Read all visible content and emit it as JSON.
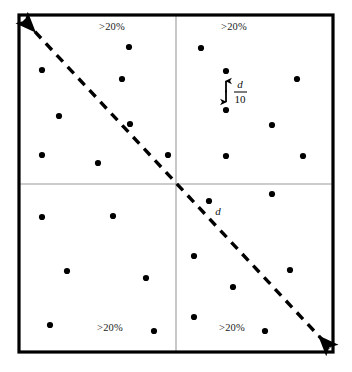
{
  "figure": {
    "name": "quadrant-point-distribution-diagram",
    "canvas": {
      "width": 352,
      "height": 372
    },
    "colors": {
      "background": "#ffffff",
      "border": "#000000",
      "gridline": "#9a9a9a",
      "point": "#000000",
      "diagonal": "#000000",
      "text": "#111111"
    },
    "frame": {
      "left": 19,
      "top": 15,
      "right": 333,
      "bottom": 352,
      "stroke_width": 3.2
    },
    "gridlines": {
      "vertical_x": 176,
      "horizontal_y": 184,
      "stroke_width": 1.1
    },
    "quadrants": [
      {
        "name": "top-left",
        "label": ">20%",
        "label_x": 112,
        "label_y": 28
      },
      {
        "name": "top-right",
        "label": ">20%",
        "label_x": 234,
        "label_y": 28
      },
      {
        "name": "bottom-left",
        "label": ">20%",
        "label_x": 110,
        "label_y": 329
      },
      {
        "name": "bottom-right",
        "label": ">20%",
        "label_x": 232,
        "label_y": 329
      }
    ],
    "diagonal": {
      "name": "double-headed-dashed-diagonal",
      "from_x": 24,
      "from_y": 20,
      "to_x": 330,
      "to_y": 348,
      "stroke_width": 3.4,
      "dash": "9 7",
      "arrowheads": "both"
    },
    "points": [
      {
        "x": 129,
        "y": 47
      },
      {
        "x": 42,
        "y": 70
      },
      {
        "x": 122,
        "y": 79
      },
      {
        "x": 59,
        "y": 116
      },
      {
        "x": 130,
        "y": 124
      },
      {
        "x": 42,
        "y": 155
      },
      {
        "x": 98,
        "y": 163
      },
      {
        "x": 168,
        "y": 155
      },
      {
        "x": 201,
        "y": 48
      },
      {
        "x": 226,
        "y": 71
      },
      {
        "x": 297,
        "y": 79
      },
      {
        "x": 226,
        "y": 110
      },
      {
        "x": 272,
        "y": 125
      },
      {
        "x": 226,
        "y": 156
      },
      {
        "x": 303,
        "y": 156
      },
      {
        "x": 42,
        "y": 217
      },
      {
        "x": 113,
        "y": 216
      },
      {
        "x": 67,
        "y": 271
      },
      {
        "x": 146,
        "y": 278
      },
      {
        "x": 50,
        "y": 325
      },
      {
        "x": 154,
        "y": 331
      },
      {
        "x": 209,
        "y": 201
      },
      {
        "x": 272,
        "y": 194
      },
      {
        "x": 194,
        "y": 256
      },
      {
        "x": 290,
        "y": 270
      },
      {
        "x": 233,
        "y": 287
      },
      {
        "x": 194,
        "y": 317
      },
      {
        "x": 265,
        "y": 331
      }
    ],
    "annotations": {
      "spacing_measure": {
        "name": "d-over-10-measure",
        "arrow_x": 226,
        "arrow_top_y": 78,
        "arrow_bottom_y": 105,
        "numerator": "d",
        "denominator": "10",
        "label_x": 240,
        "numerator_y": 85,
        "bar_y": 92,
        "denominator_y": 100,
        "bar_x1": 234,
        "bar_x2": 247
      },
      "diagonal_distance": {
        "name": "d-label",
        "text": "d",
        "x": 218,
        "y": 212
      }
    }
  }
}
